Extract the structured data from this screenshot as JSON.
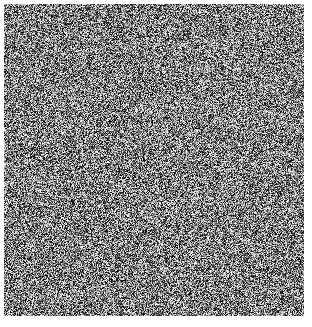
{
  "canvas": {
    "width": 312,
    "height": 327,
    "background_color": "#ffffff"
  },
  "noise_field": {
    "label": "grayscale-random-noise",
    "description": "Uniform per-pixel grayscale random noise field (static / white noise). No structure, text or gradient.",
    "x": 4,
    "y": 4,
    "width": 300,
    "height": 312,
    "grain_size_px": 1,
    "color_mode": "grayscale",
    "min_level": 0,
    "max_level": 255,
    "mean_level": 128,
    "distribution": "uniform",
    "seed": 20240517
  }
}
